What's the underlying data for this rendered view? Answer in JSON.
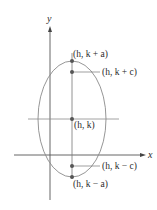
{
  "diagram": {
    "type": "ellipse-vertical-major-axis",
    "axes": {
      "x_label": "x",
      "y_label": "y"
    },
    "ellipse": {
      "center": "(h, k)",
      "stroke_color": "#8a8a8a"
    },
    "points": [
      {
        "id": "vertex_top",
        "label": "(h, k + a)"
      },
      {
        "id": "focus_top",
        "label": "(h, k + c)"
      },
      {
        "id": "center",
        "label": "(h, k)"
      },
      {
        "id": "focus_bottom",
        "label": "(h, k − c)"
      },
      {
        "id": "vertex_bottom",
        "label": "(h, k − a)"
      }
    ],
    "colors": {
      "axis": "#555555",
      "curve": "#8a8a8a",
      "point": "#555555",
      "text": "#2b2b2b"
    }
  }
}
